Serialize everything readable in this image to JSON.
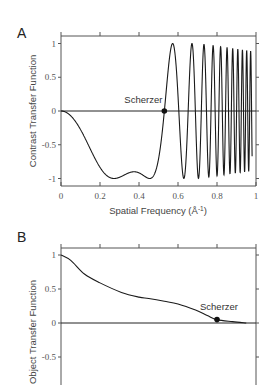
{
  "chart_data": [
    {
      "panel": "A",
      "type": "line",
      "title": "",
      "xlabel": "Spatial Frequency (Å-1)",
      "ylabel": "Contrast Transfer Function",
      "xlim": [
        0,
        1
      ],
      "ylim": [
        -1.1,
        1.1
      ],
      "xticks": [
        "0",
        "0.2",
        "0.4",
        "0.6",
        "0.8",
        "1"
      ],
      "yticks": [
        "1",
        "0.5",
        "0",
        "-0.5",
        "-1"
      ],
      "ytick_values": [
        1,
        0.5,
        0,
        -0.5,
        -1
      ],
      "grid": false,
      "zero_line": true,
      "model": {
        "formula": "sin(pi*(A*k^4 - B*k^2))",
        "A": 32.6,
        "B": 9.16,
        "k_max": 0.98
      },
      "key_points": [
        {
          "x": 0.0,
          "y": 0.0
        },
        {
          "x": 0.25,
          "y": -1.0
        },
        {
          "x": 0.375,
          "y": -0.9
        },
        {
          "x": 0.45,
          "y": -1.0
        },
        {
          "x": 0.53,
          "y": 0.0
        },
        {
          "x": 0.57,
          "y": 1.0
        }
      ],
      "annotation": {
        "text": "Scherzer",
        "x": 0.53,
        "y": 0.0
      }
    },
    {
      "panel": "B",
      "type": "line",
      "title": "",
      "xlabel": "",
      "ylabel": "Object Transfer Function",
      "xlim": [
        0,
        1
      ],
      "ylim": [
        -1.1,
        1.1
      ],
      "xticks": [],
      "yticks": [
        "1",
        "0.5",
        "0",
        "-0.5"
      ],
      "ytick_values": [
        1,
        0.5,
        0,
        -0.5
      ],
      "grid": false,
      "zero_line": true,
      "x": [
        0.0,
        0.05,
        0.12,
        0.2,
        0.31,
        0.4,
        0.45,
        0.53,
        0.6,
        0.69,
        0.75,
        0.8,
        0.88,
        0.95
      ],
      "y": [
        1.0,
        0.92,
        0.72,
        0.59,
        0.45,
        0.38,
        0.36,
        0.32,
        0.28,
        0.19,
        0.11,
        0.05,
        0.02,
        0.0
      ],
      "annotation": {
        "text": "Scherzer",
        "x": 0.8,
        "y": 0.05
      }
    }
  ],
  "panels": {
    "a": {
      "label": "A",
      "ylabel": "Contrast Transfer Function",
      "xlabel": "Spatial Frequency (Å-1)",
      "annotation": "Scherzer"
    },
    "b": {
      "label": "B",
      "ylabel": "Object Transfer Function",
      "annotation": "Scherzer"
    }
  }
}
